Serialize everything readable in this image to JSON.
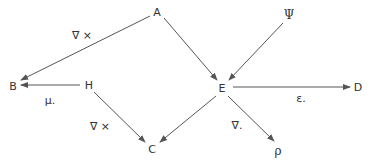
{
  "diagram": {
    "type": "directed-graph",
    "colors": {
      "edge": "#555555",
      "text": "#333333",
      "background": "#ffffff"
    },
    "nodes": {
      "A": {
        "label": "A",
        "x": 157,
        "y": 12
      },
      "Psi": {
        "label": "Ψ",
        "x": 288,
        "y": 15
      },
      "B": {
        "label": "B",
        "x": 13,
        "y": 85
      },
      "H": {
        "label": "H",
        "x": 89,
        "y": 84
      },
      "E": {
        "label": "E",
        "x": 222,
        "y": 88
      },
      "D": {
        "label": "D",
        "x": 357,
        "y": 86
      },
      "C": {
        "label": "C",
        "x": 152,
        "y": 148
      },
      "rho": {
        "label": "ρ",
        "x": 278,
        "y": 150
      }
    },
    "edges": [
      {
        "from": "A",
        "to": "B",
        "label": "∇ ×"
      },
      {
        "from": "A",
        "to": "E",
        "label": ""
      },
      {
        "from": "Psi",
        "to": "E",
        "label": ""
      },
      {
        "from": "H",
        "to": "B",
        "label": "μ."
      },
      {
        "from": "H",
        "to": "C",
        "label": "∇ ×"
      },
      {
        "from": "E",
        "to": "C",
        "label": ""
      },
      {
        "from": "E",
        "to": "D",
        "label": "ε."
      },
      {
        "from": "E",
        "to": "rho",
        "label": "∇."
      }
    ],
    "edge_labels": {
      "curl_A_B": "∇ ×",
      "mu_H_B": "μ.",
      "curl_H_C": "∇ ×",
      "div_E_rho": "∇.",
      "eps_E_D": "ε."
    }
  }
}
